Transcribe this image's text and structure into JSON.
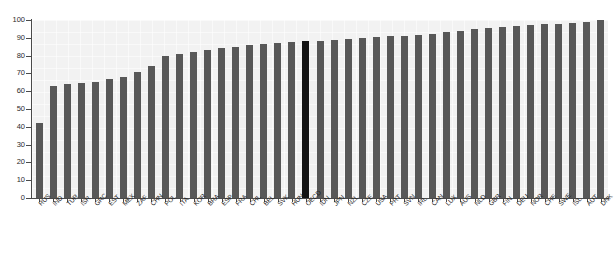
{
  "chart": {
    "title": "",
    "type": "bar"
  },
  "chart_data": {
    "type": "bar",
    "title": "",
    "subtitle": "",
    "xlabel": "",
    "ylabel": "",
    "ylim": [
      0,
      100
    ],
    "yticks": [
      0,
      10,
      20,
      30,
      40,
      50,
      60,
      70,
      80,
      90,
      100
    ],
    "grid": true,
    "legend": "none",
    "bar_color": "#585858",
    "highlight_color": "#141414",
    "highlight_category": "OECD",
    "background_color": "#f2f2f2",
    "categories": [
      "RUS",
      "IND",
      "TUR",
      "ISR",
      "GRC",
      "EST",
      "MEX",
      "ZAF",
      "CHN",
      "POL",
      "ITA",
      "KOR",
      "BRA",
      "ESP",
      "FRA",
      "CHL",
      "BEL",
      "SVK",
      "HUN",
      "OECD",
      "IDN",
      "JPN",
      "NZL",
      "CZE",
      "USA",
      "PRT",
      "SVN",
      "IRL",
      "CAN",
      "LUX",
      "AUS",
      "NLD",
      "GBR",
      "FIN",
      "DEU",
      "NOR",
      "CHE",
      "SWE",
      "ISL",
      "AUT",
      "DNK"
    ],
    "values": [
      42,
      63,
      64,
      64.5,
      65,
      67,
      68,
      71,
      74,
      80,
      81,
      82,
      83,
      84,
      85,
      86,
      86.5,
      87,
      87.5,
      88,
      88,
      89,
      89.5,
      90,
      90.5,
      91,
      91,
      91.5,
      92,
      93,
      94,
      95,
      95.5,
      96,
      96.5,
      97,
      97.5,
      98,
      98.5,
      99,
      100
    ]
  }
}
